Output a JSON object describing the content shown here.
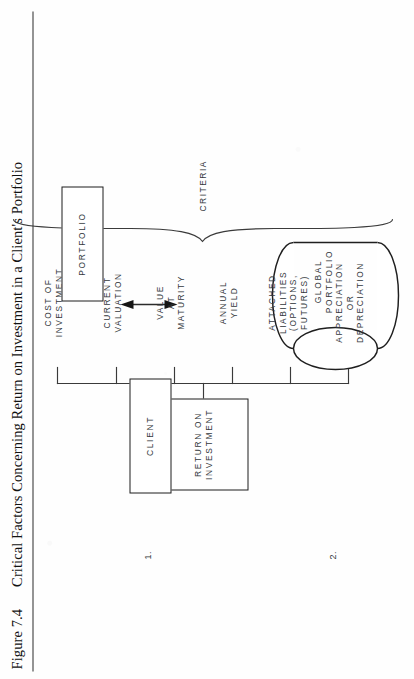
{
  "figure": {
    "number": "Figure 7.4",
    "title": "Critical Factors Concerning Return on Investment in a Client's Portfolio"
  },
  "diagram": {
    "root_box": {
      "label": "RETURN ON\nINVESTMENT"
    },
    "factors": [
      {
        "index": 1,
        "label": "COST OF\nINVESTMENT"
      },
      {
        "index": 2,
        "label": "CURRENT\nVALUATION"
      },
      {
        "index": 3,
        "label": "VALUE\nAT\nMATURITY"
      },
      {
        "index": 4,
        "label": "ANNUAL\nYIELD"
      },
      {
        "index": 5,
        "label": "ATTACHED\nLIABILITIES\n(OPTIONS,\nFUTURES)"
      },
      {
        "index": 6,
        "label": "APPRECIATION\nOR\nDEPRECIATION"
      }
    ],
    "brace_label": "CRITERIA",
    "entities": [
      {
        "marker": "1.",
        "name": "client-box",
        "label": "CLIENT"
      },
      {
        "marker": "2.",
        "name": "global-portfolio-cylinder",
        "label": "GLOBAL\nPORTFOLIO"
      }
    ],
    "portfolio_box": {
      "label": "PORTFOLIO"
    },
    "relation": {
      "from": "CLIENT",
      "to": "PORTFOLIO",
      "arrow": "double-headed"
    }
  },
  "colors": {
    "ink": "#1d1d1d",
    "text": "#33383c",
    "paper": "#fefefe",
    "rule": "#2a2a2a"
  }
}
